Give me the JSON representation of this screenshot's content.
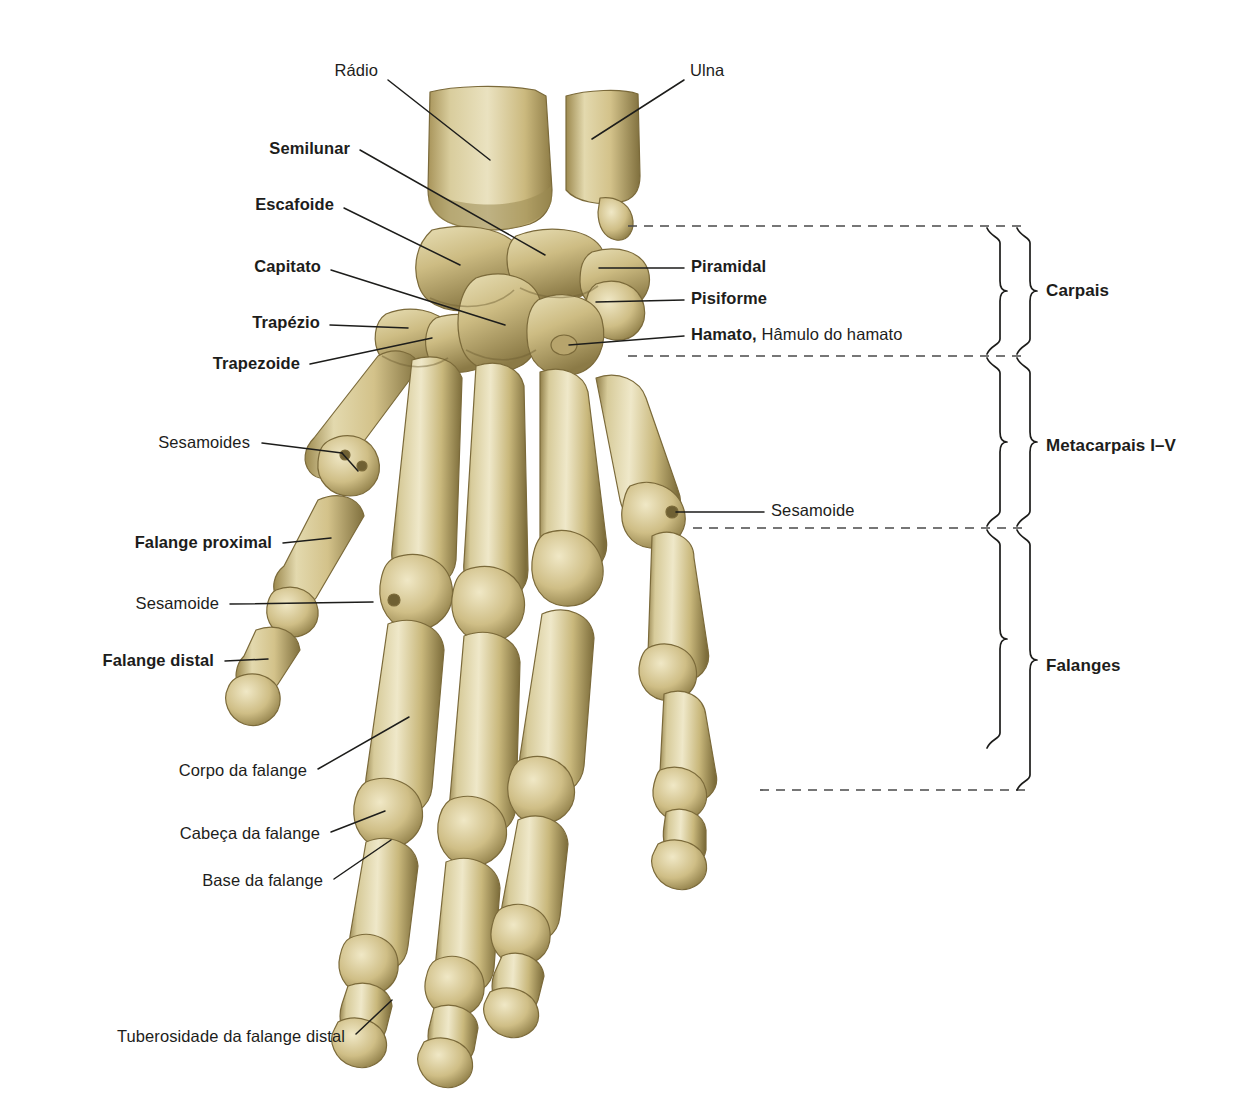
{
  "figure": {
    "language": "pt-BR",
    "background_color": "#ffffff",
    "bone_color_light": "#e2d7ab",
    "bone_color_mid": "#c9b87c",
    "bone_color_dark": "#8a7844",
    "leader_line_color": "#1d1d1b",
    "dashed_line_color": "#555555",
    "text_color": "#1d1d1b"
  },
  "labels_left": [
    {
      "id": "radio",
      "text": "Rádio",
      "bold": false,
      "x": 378,
      "y": 72
    },
    {
      "id": "semilunar",
      "text": "Semilunar",
      "bold": true,
      "x": 350,
      "y": 150
    },
    {
      "id": "escafoide",
      "text": "Escafoide",
      "bold": true,
      "x": 334,
      "y": 206
    },
    {
      "id": "capitato",
      "text": "Capitato",
      "bold": true,
      "x": 321,
      "y": 268
    },
    {
      "id": "trapezio",
      "text": "Trapézio",
      "bold": true,
      "x": 320,
      "y": 324
    },
    {
      "id": "trapezoide",
      "text": "Trapezoide",
      "bold": true,
      "x": 300,
      "y": 365
    },
    {
      "id": "sesamoides",
      "text": "Sesamoides",
      "bold": false,
      "x": 250,
      "y": 444
    },
    {
      "id": "falange-proximal",
      "text": "Falange proximal",
      "bold": true,
      "x": 272,
      "y": 544
    },
    {
      "id": "sesamoide-esq",
      "text": "Sesamoide",
      "bold": false,
      "x": 219,
      "y": 605
    },
    {
      "id": "falange-distal",
      "text": "Falange distal",
      "bold": true,
      "x": 214,
      "y": 662
    },
    {
      "id": "corpo-falange",
      "text": "Corpo da falange",
      "bold": false,
      "x": 307,
      "y": 772
    },
    {
      "id": "cabeca-falange",
      "text": "Cabeça da falange",
      "bold": false,
      "x": 320,
      "y": 835
    },
    {
      "id": "base-falange",
      "text": "Base da falange",
      "bold": false,
      "x": 323,
      "y": 882
    },
    {
      "id": "tuberosidade",
      "text": "Tuberosidade da falange distal",
      "bold": false,
      "x": 345,
      "y": 1038
    }
  ],
  "labels_right": [
    {
      "id": "ulna",
      "text": "Ulna",
      "bold": false,
      "x": 690,
      "y": 72
    },
    {
      "id": "piramidal",
      "text": "Piramidal",
      "bold": true,
      "x": 691,
      "y": 268
    },
    {
      "id": "pisiforme",
      "text": "Pisiforme",
      "bold": true,
      "x": 691,
      "y": 300
    },
    {
      "id": "hamato",
      "text": "Hamato,",
      "sub": " Hâmulo do hamato",
      "bold": true,
      "x": 691,
      "y": 336
    },
    {
      "id": "sesamoide-dir",
      "text": "Sesamoide",
      "bold": false,
      "x": 771,
      "y": 512
    }
  ],
  "group_labels": [
    {
      "id": "carpais",
      "text": "Carpais",
      "x": 1046,
      "y": 292
    },
    {
      "id": "metacarpais",
      "text": "Metacarpais I–V",
      "x": 1046,
      "y": 447
    },
    {
      "id": "falanges",
      "text": "Falanges",
      "x": 1046,
      "y": 667
    }
  ],
  "dashed_lines": [
    {
      "id": "dash-carpais-top",
      "x1": 628,
      "x2": 1028,
      "y": 226
    },
    {
      "id": "dash-carpais-bottom",
      "x1": 628,
      "x2": 1028,
      "y": 356
    },
    {
      "id": "dash-metacarpais-bottom",
      "x1": 693,
      "x2": 1028,
      "y": 528
    },
    {
      "id": "dash-falanges-bottom",
      "x1": 760,
      "x2": 1028,
      "y": 790
    }
  ],
  "brackets_inner": [
    {
      "id": "bracket-carpais-inner",
      "top": 228,
      "bottom": 354,
      "x": 1000
    },
    {
      "id": "bracket-metacarpais-inner",
      "top": 358,
      "bottom": 526,
      "x": 1000
    },
    {
      "id": "bracket-falanges-inner",
      "top": 530,
      "bottom": 748,
      "x": 1000
    }
  ],
  "brackets_outer": [
    {
      "id": "bracket-carpais-outer",
      "top": 228,
      "bottom": 354,
      "x": 1030
    },
    {
      "id": "bracket-metacarpais-outer",
      "top": 358,
      "bottom": 526,
      "x": 1030
    },
    {
      "id": "bracket-falanges-outer",
      "top": 530,
      "bottom": 790,
      "x": 1030
    }
  ],
  "leader_lines": [
    {
      "id": "leader-radio",
      "pts": "388,80 490,160"
    },
    {
      "id": "leader-semilunar",
      "pts": "360,150 545,255"
    },
    {
      "id": "leader-escafoide",
      "pts": "344,208 460,265"
    },
    {
      "id": "leader-capitato",
      "pts": "331,270 505,325"
    },
    {
      "id": "leader-trapezio",
      "pts": "330,325 408,328"
    },
    {
      "id": "leader-trapezoide",
      "pts": "310,364 432,338"
    },
    {
      "id": "leader-sesamoides-a",
      "pts": "262,443 342,453"
    },
    {
      "id": "leader-sesamoides-b",
      "pts": "342,453 358,471"
    },
    {
      "id": "leader-falange-proximal",
      "pts": "283,543 331,538"
    },
    {
      "id": "leader-sesamoide-esq",
      "pts": "230,604 373,602"
    },
    {
      "id": "leader-falange-distal",
      "pts": "225,661 268,659"
    },
    {
      "id": "leader-corpo",
      "pts": "318,769 409,717"
    },
    {
      "id": "leader-cabeca",
      "pts": "331,832 385,811"
    },
    {
      "id": "leader-base",
      "pts": "334,879 391,840"
    },
    {
      "id": "leader-tuberosidade",
      "pts": "356,1034 392,1000"
    },
    {
      "id": "leader-ulna",
      "pts": "684,80 592,139"
    },
    {
      "id": "leader-piramidal",
      "pts": "684,268 599,268"
    },
    {
      "id": "leader-pisiforme",
      "pts": "684,300 596,302"
    },
    {
      "id": "leader-hamato",
      "pts": "684,336 569,345"
    },
    {
      "id": "leader-sesamoide-dir",
      "pts": "764,512 676,512"
    }
  ]
}
